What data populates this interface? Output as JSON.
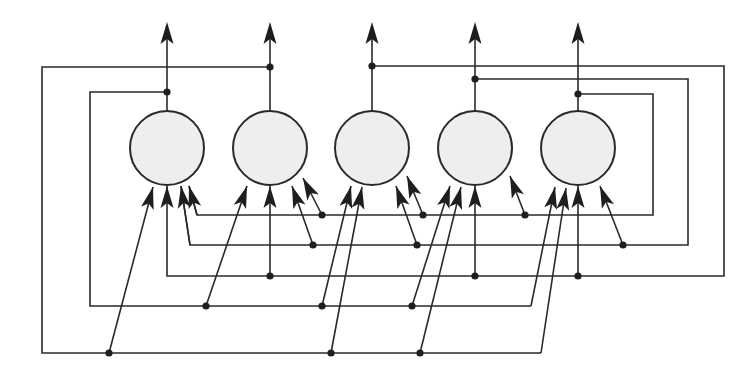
{
  "diagram": {
    "title": "",
    "type": "recurrent-network",
    "colors": {
      "line": "#2a2a2a",
      "neuron_fill": "#eeeeee",
      "background": "#ffffff"
    },
    "neurons": [
      {
        "id": "n1",
        "cx": 167,
        "cy": 148
      },
      {
        "id": "n2",
        "cx": 270,
        "cy": 148
      },
      {
        "id": "n3",
        "cx": 372,
        "cy": 148
      },
      {
        "id": "n4",
        "cx": 475,
        "cy": 148
      },
      {
        "id": "n5",
        "cx": 578,
        "cy": 148
      }
    ],
    "neuron_radius": 37,
    "output_arrow_top_y": 22,
    "feedback_buses": [
      {
        "from": "n1",
        "tap": [
          167,
          92
        ],
        "route": [
          [
            167,
            92
          ],
          [
            90,
            92
          ],
          [
            90,
            306
          ],
          [
            531,
            306
          ]
        ],
        "taps_to": [
          {
            "to": "n2",
            "dot": [
              206,
              306
            ],
            "head": [
              247,
              186
            ]
          },
          {
            "to": "n3",
            "dot": [
              322,
              306
            ],
            "head": [
              351,
              186
            ]
          },
          {
            "to": "n4",
            "dot": [
              412,
              306
            ],
            "head": [
              450,
              186
            ]
          },
          {
            "to": "n5",
            "end": [
              531,
              306
            ],
            "head": [
              555,
              187
            ]
          }
        ]
      },
      {
        "from": "n2",
        "tap": [
          270,
          67
        ],
        "route": [
          [
            270,
            67
          ],
          [
            42,
            67
          ],
          [
            42,
            353
          ],
          [
            541,
            353
          ]
        ],
        "taps_to": [
          {
            "to": "n1",
            "dot": [
              109,
              353
            ],
            "head": [
              153,
              187
            ]
          },
          {
            "to": "n3",
            "dot": [
              331,
              353
            ],
            "head": [
              362,
              187
            ]
          },
          {
            "to": "n4",
            "dot": [
              420,
              353
            ],
            "head": [
              461,
              187
            ]
          },
          {
            "to": "n5",
            "end": [
              541,
              353
            ],
            "head": [
              566,
              188
            ]
          }
        ]
      },
      {
        "from": "n3",
        "tap": [
          372,
          66
        ],
        "route": [
          [
            372,
            66
          ],
          [
            724,
            66
          ],
          [
            724,
            276
          ],
          [
            167,
            276
          ],
          [
            167,
            186
          ]
        ],
        "taps_to": [
          {
            "to": "n1",
            "end": [
              167,
              276
            ],
            "head": [
              167,
              186
            ]
          },
          {
            "to": "n2",
            "dot": [
              270,
              276
            ],
            "head": [
              270,
              186
            ]
          },
          {
            "to": "n4",
            "dot": [
              475,
              276
            ],
            "head": [
              475,
              186
            ]
          },
          {
            "to": "n5",
            "dot": [
              578,
              276
            ],
            "head": [
              578,
              186
            ]
          }
        ]
      },
      {
        "from": "n4",
        "tap": [
          475,
          79
        ],
        "route": [
          [
            475,
            79
          ],
          [
            688,
            79
          ],
          [
            688,
            245
          ],
          [
            190,
            245
          ],
          [
            181,
            186
          ]
        ],
        "taps_to": [
          {
            "to": "n1",
            "end": [
              190,
              245
            ],
            "head": [
              181,
              186
            ]
          },
          {
            "to": "n2",
            "dot": [
              313,
              245
            ],
            "head": [
              292,
              186
            ]
          },
          {
            "to": "n3",
            "dot": [
              417,
              245
            ],
            "head": [
              396,
              186
            ]
          },
          {
            "to": "n5",
            "dot": [
              623,
              245
            ],
            "head": [
              600,
              186
            ]
          }
        ]
      },
      {
        "from": "n5",
        "tap": [
          578,
          94
        ],
        "route": [
          [
            578,
            94
          ],
          [
            653,
            94
          ],
          [
            653,
            215
          ],
          [
            197,
            215
          ],
          [
            189,
            186
          ]
        ],
        "taps_to": [
          {
            "to": "n1",
            "end": [
              197,
              215
            ],
            "head": [
              189,
              186
            ]
          },
          {
            "to": "n2",
            "dot": [
              322,
              215
            ],
            "head": [
              303,
              178
            ]
          },
          {
            "to": "n3",
            "dot": [
              423,
              215
            ],
            "head": [
              407,
              176
            ]
          },
          {
            "to": "n4",
            "dot": [
              525,
              215
            ],
            "head": [
              510,
              176
            ]
          }
        ]
      }
    ]
  }
}
